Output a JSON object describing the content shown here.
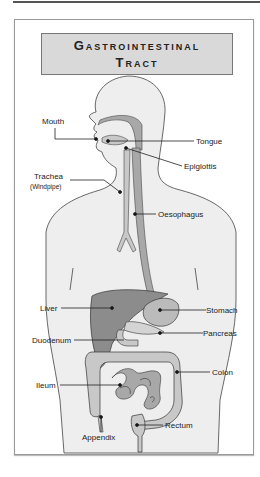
{
  "title": {
    "line1": "Gastrointestinal",
    "line2": "Tract"
  },
  "labels": {
    "mouth": "Mouth",
    "tongue": "Tongue",
    "epiglottis": "Epiglottis",
    "trachea": "Trachea",
    "windpipe": "(Windpipe)",
    "oesophagus": "Oesophagus",
    "liver": "Liver",
    "stomach": "Stomach",
    "pancreas": "Pancreas",
    "duodenum": "Duodenum",
    "colon": "Colon",
    "ileum": "Ileum",
    "rectum": "Rectum",
    "appendix": "Appendix"
  },
  "colors": {
    "body_fill": "#eeeeee",
    "organ_dark": "#8c8c8c",
    "organ_mid": "#a8a8a8",
    "organ_light": "#c8c8c8",
    "title_bg": "#d9d9d9",
    "outline": "#333333"
  }
}
